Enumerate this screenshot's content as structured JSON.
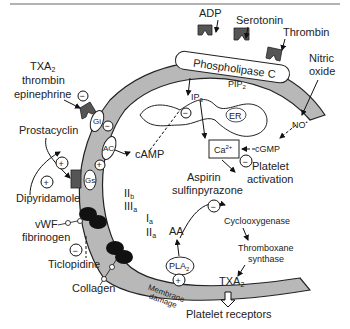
{
  "diagram": {
    "colors": {
      "membrane": "#b8b8b8",
      "receptor": "#555555",
      "glycoprotein": "#111111",
      "text": "#222222",
      "background": "#ffffff"
    },
    "agonists": {
      "adp": "ADP",
      "serotonin": "Serotonin",
      "thrombin": "Thrombin",
      "nitric_oxide_line1": "Nitric",
      "nitric_oxide_line2": "oxide",
      "txa2_group_line1": "TXA",
      "txa2_group_sub": "2",
      "txa2_group_line2": "thrombin",
      "txa2_group_line3": "epinephrine",
      "prostacyclin": "Prostacyclin",
      "dipyridamole": "Dipyridamole",
      "vwf": "vWF",
      "fibrinogen": "fibrinogen",
      "ticlopidine": "Ticlopidine",
      "collagen": "Collagen"
    },
    "membrane_components": {
      "phospholipase_c": "Phospholipase C",
      "pip2": "PIP",
      "pip2_sub": "2",
      "gi": "Gi",
      "ac": "AC",
      "gs": "Gs",
      "iib": "II",
      "iib_sub": "b",
      "iiia": "III",
      "iiia_sub": "a",
      "ia": "I",
      "ia_sub": "a",
      "iia": "II",
      "iia_sub": "a",
      "pla2": "PLA",
      "pla2_sub": "2",
      "membrane_damage_line1": "Membrane",
      "membrane_damage_line2": "damage",
      "txa2_membrane": "TXA",
      "txa2_membrane_sub": "2"
    },
    "intracellular": {
      "ip3": "IP",
      "ip3_sub": "3",
      "er": "ER",
      "camp": "cAMP",
      "ca2": "Ca",
      "ca2_sup": "2+",
      "cgmp": "cGMP",
      "no": "NO",
      "no_sup": "•",
      "platelet_activation_line1": "Platelet",
      "platelet_activation_line2": "activation",
      "aspirin": "Aspirin",
      "sulfinpyrazone": "sulfinpyrazone",
      "aa": "AA",
      "cyclooxygenase": "Cyclooxygenase",
      "thromboxane_line1": "Thromboxane",
      "thromboxane_line2": "synthase"
    },
    "output": {
      "platelet_receptors": "Platelet receptors"
    },
    "signs": {
      "plus": "+",
      "minus": "−"
    }
  }
}
